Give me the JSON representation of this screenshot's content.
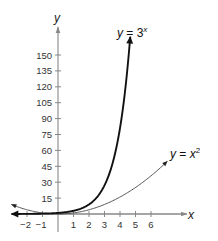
{
  "chart_data": {
    "type": "line",
    "title": "",
    "xlabel": "x",
    "ylabel": "y",
    "xlim": [
      -3,
      7.5
    ],
    "ylim": [
      0,
      170
    ],
    "x_ticks": [
      -2,
      -1,
      1,
      2,
      3,
      4,
      5,
      6
    ],
    "y_ticks": [
      15,
      30,
      45,
      60,
      75,
      90,
      105,
      120,
      135,
      150
    ],
    "grid": false,
    "legend": "none (inline curve labels)",
    "series": [
      {
        "name": "y = 3^x",
        "label_base": "y = 3",
        "label_exp": "x",
        "style": "bold",
        "color": "#111111",
        "x": [
          -3,
          -2,
          -1,
          0,
          1,
          2,
          3,
          4,
          4.65
        ],
        "values": [
          0.04,
          0.11,
          0.33,
          1,
          3,
          9,
          27,
          81,
          165
        ]
      },
      {
        "name": "y = x^2",
        "label_base": "y = x",
        "label_exp": "2",
        "style": "thin",
        "color": "#555555",
        "x": [
          -3,
          -2,
          -1,
          0,
          1,
          2,
          3,
          4,
          5,
          6,
          7
        ],
        "values": [
          9,
          4,
          1,
          0,
          1,
          4,
          9,
          16,
          25,
          36,
          49
        ]
      }
    ]
  },
  "axes": {
    "x_label": "x",
    "y_label": "y"
  }
}
